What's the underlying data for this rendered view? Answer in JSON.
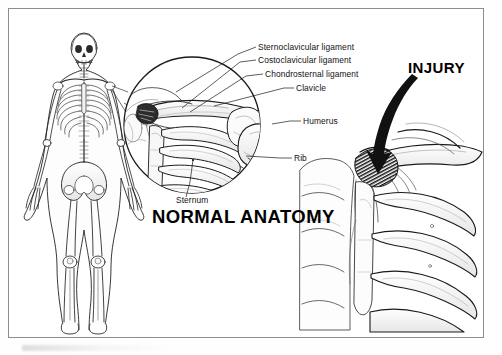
{
  "figure": {
    "border_color": "#8d8d8d",
    "ink_color": "#111111",
    "background": "#ffffff"
  },
  "panels": {
    "left": {
      "name": "full-body-skeleton",
      "description": "Anterior view of a full human skeleton within a body outline, female figure, standing"
    },
    "center": {
      "name": "normal-anatomy-magnifier",
      "heading": "NORMAL ANATOMY",
      "description": "Circular magnified inset of the right sternoclavicular region showing clavicle, ribs, sternum and humerus"
    },
    "right": {
      "name": "injury-illustration",
      "heading": "INJURY",
      "description": "Sternoclavicular joint with torn ligament fibers, black curved arrow indicating direction of force"
    }
  },
  "labels": [
    {
      "id": "sternoclavicular",
      "text": "Sternoclavicular ligament"
    },
    {
      "id": "costoclavicular",
      "text": "Costoclavicular ligament"
    },
    {
      "id": "chondrosternal",
      "text": "Chondrosternal ligament"
    },
    {
      "id": "clavicle",
      "text": "Clavicle"
    },
    {
      "id": "humerus",
      "text": "Humerus"
    },
    {
      "id": "rib",
      "text": "Rib"
    },
    {
      "id": "sternum",
      "text": "Sternum"
    }
  ]
}
